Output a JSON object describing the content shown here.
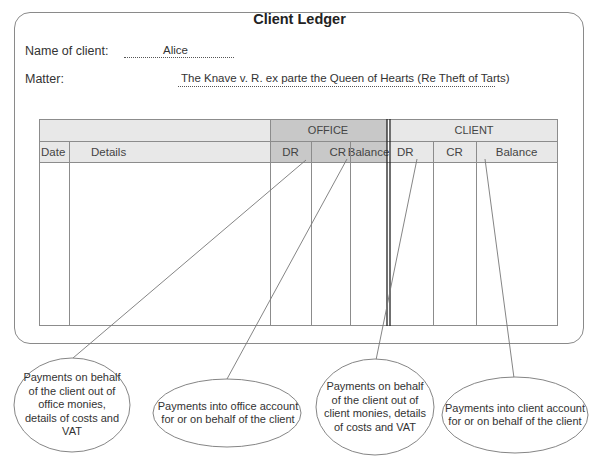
{
  "ledger": {
    "title": "Client Ledger",
    "client_label": "Name of client:",
    "client_value": "Alice",
    "matter_label": "Matter:",
    "matter_value": "The Knave v. R. ex parte the Queen of Hearts (Re Theft of Tarts)"
  },
  "table": {
    "groups": {
      "office": "OFFICE",
      "client": "CLIENT"
    },
    "columns": {
      "date": "Date",
      "details": "Details",
      "office_dr": "DR",
      "office_cr": "CR",
      "office_balance": "Balance",
      "client_dr": "DR",
      "client_cr": "CR",
      "client_balance": "Balance"
    },
    "colors": {
      "header_light": "#e6e6e6",
      "header_office": "#c9c9c9",
      "border": "#8c8c8c"
    }
  },
  "callouts": [
    {
      "target": "Office DR",
      "text": "Payments on behalf of the client out of office monies, details of costs and VAT"
    },
    {
      "target": "Office CR",
      "text": "Payments into office account for or on behalf of the client"
    },
    {
      "target": "Client DR",
      "text": "Payments on behalf of the client out of client monies, details of costs and VAT"
    },
    {
      "target": "Client CR",
      "text": "Payments into client account for or on behalf of the client"
    }
  ]
}
